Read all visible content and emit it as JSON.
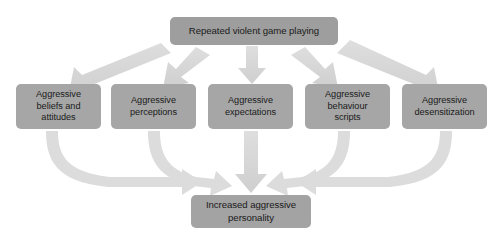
{
  "diagram": {
    "title_node": {
      "id": "repeated-violent-game-playing",
      "label": "Repeated violent game playing"
    },
    "mediator_nodes": [
      {
        "id": "aggressive-beliefs-and-attitudes",
        "label": "Aggressive\nbeliefs and\nattitudes"
      },
      {
        "id": "aggressive-perceptions",
        "label": "Aggressive\nperceptions"
      },
      {
        "id": "aggressive-expectations",
        "label": "Aggressive\nexpectations"
      },
      {
        "id": "aggressive-behaviour-scripts",
        "label": "Aggressive\nbehaviour\nscripts"
      },
      {
        "id": "aggressive-desensitization",
        "label": "Aggressive\ndesensitization"
      }
    ],
    "outcome_node": {
      "id": "increased-aggressive-personality",
      "label": "Increased aggressive\npersonality"
    },
    "colors": {
      "box_fill": "#a6a6a6",
      "box_text": "#1a1a1a",
      "arrow_fill": "#d2d2d2",
      "arrow_fill_light": "#dcdcdc",
      "background": "#ffffff"
    },
    "arrows": {
      "top_fanout_count": 5,
      "bottom_converge_count": 5,
      "direction_top": "downward-fan",
      "direction_bottom": "downward-converge"
    }
  }
}
